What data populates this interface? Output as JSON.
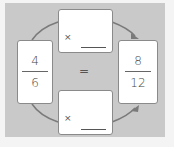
{
  "left_fraction": {
    "numerator": "4",
    "denominator": "6"
  },
  "right_fraction": {
    "numerator": "8",
    "denominator": "12"
  },
  "equals_sign": "=",
  "top_multiplier": {
    "operator": "×",
    "value": ""
  },
  "bottom_multiplier": {
    "operator": "×",
    "value": ""
  },
  "colors": {
    "panel": "#c9c9c9",
    "card": "#ffffff",
    "border": "#8a8a8a",
    "arrow": "#7a7a7a"
  }
}
